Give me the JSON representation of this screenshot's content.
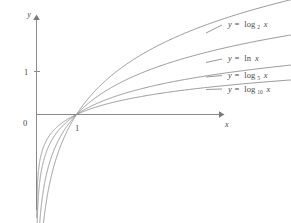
{
  "figure": {
    "background_color": "#ffffff",
    "curve_color": "#8c8c8c",
    "axis_color": "#8a8a8a",
    "text_color": "#4a4a4a"
  },
  "axes": {
    "x_axis_label": "x",
    "y_axis_label": "y",
    "origin_label": "0",
    "x_tick_label": "1",
    "y_tick_label": "1",
    "x_range": [
      -0.1,
      9.2
    ],
    "y_range": [
      -4.6,
      3.6
    ],
    "grid": false,
    "x_ticks": [
      1
    ],
    "y_ticks": [
      1
    ]
  },
  "labels": {
    "log2": {
      "lhs": "y =",
      "fn": "log",
      "sub": "2",
      "arg": "x",
      "full": "y = log₂ x"
    },
    "ln": {
      "lhs": "y =",
      "fn": "ln",
      "sub": "",
      "arg": "x",
      "full": "y = ln x"
    },
    "log5": {
      "lhs": "y =",
      "fn": "log",
      "sub": "5",
      "arg": "x",
      "full": "y = log₅ x"
    },
    "log10": {
      "lhs": "y =",
      "fn": "log",
      "sub": "10",
      "arg": "x",
      "full": "y = log₁₀ x"
    }
  },
  "chart_data": {
    "type": "line",
    "title": "",
    "xlabel": "x",
    "ylabel": "y",
    "xlim": [
      -0.1,
      9.2
    ],
    "ylim": [
      -4.6,
      3.6
    ],
    "grid": false,
    "legend_position": "right-inline",
    "annotations": [
      "0",
      "1",
      "1"
    ],
    "x": [
      0.02,
      0.04,
      0.06,
      0.09,
      0.13,
      0.18,
      0.25,
      0.33,
      0.45,
      0.6,
      0.8,
      1.0,
      1.3,
      1.7,
      2.2,
      2.8,
      3.5,
      4.3,
      5.2,
      6.2,
      7.3,
      8.5,
      9.2
    ],
    "series": [
      {
        "name": "y = log₂ x",
        "base": 2,
        "label_key": "log2",
        "values": [
          -5.644,
          -4.644,
          -4.059,
          -3.474,
          -2.943,
          -2.474,
          -2.0,
          -1.6,
          -1.152,
          -0.737,
          -0.322,
          0.0,
          0.379,
          0.766,
          1.138,
          1.485,
          1.807,
          2.104,
          2.379,
          2.632,
          2.868,
          3.087,
          3.202
        ]
      },
      {
        "name": "y = ln x",
        "base": 2.71828,
        "label_key": "ln",
        "values": [
          -3.912,
          -3.219,
          -2.813,
          -2.408,
          -2.04,
          -1.715,
          -1.386,
          -1.109,
          -0.799,
          -0.511,
          -0.223,
          0.0,
          0.262,
          0.531,
          0.788,
          1.03,
          1.253,
          1.459,
          1.649,
          1.825,
          1.988,
          2.14,
          2.219
        ]
      },
      {
        "name": "y = log₅ x",
        "base": 5,
        "label_key": "log5",
        "values": [
          -2.431,
          -2.0,
          -1.748,
          -1.496,
          -1.268,
          -1.066,
          -0.861,
          -0.689,
          -0.496,
          -0.317,
          -0.139,
          0.0,
          0.163,
          0.33,
          0.49,
          0.64,
          0.778,
          0.906,
          1.025,
          1.134,
          1.235,
          1.33,
          1.379
        ]
      },
      {
        "name": "y = log₁₀ x",
        "base": 10,
        "label_key": "log10",
        "values": [
          -1.699,
          -1.398,
          -1.222,
          -1.046,
          -0.886,
          -0.745,
          -0.602,
          -0.481,
          -0.347,
          -0.222,
          -0.097,
          0.0,
          0.114,
          0.23,
          0.342,
          0.447,
          0.544,
          0.633,
          0.716,
          0.792,
          0.863,
          0.929,
          0.964
        ]
      }
    ]
  }
}
